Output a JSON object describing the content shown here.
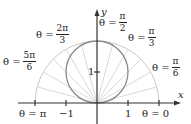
{
  "diagram": {
    "type": "polar-graph",
    "curve": "r = 2 sin θ",
    "axes": {
      "x_label": "x",
      "y_label": "y",
      "x_ticks": [
        {
          "value": -2,
          "label": "θ = π"
        },
        {
          "value": -1,
          "label": "−1"
        },
        {
          "value": 1,
          "label": "1"
        },
        {
          "value": 2,
          "label": "θ = 0"
        }
      ],
      "y_ticks": [
        {
          "value": 1,
          "label": "1"
        }
      ]
    },
    "angle_labels": [
      {
        "id": "pi_over_2",
        "prefix": "θ =",
        "num": "π",
        "den": "2"
      },
      {
        "id": "pi_over_3",
        "prefix": "θ =",
        "num": "π",
        "den": "3"
      },
      {
        "id": "pi_over_6",
        "prefix": "θ =",
        "num": "π",
        "den": "6"
      },
      {
        "id": "two_pi_over_3",
        "prefix": "θ =",
        "num": "2π",
        "den": "3"
      },
      {
        "id": "five_pi_over_6",
        "prefix": "θ =",
        "num": "5π",
        "den": "6"
      }
    ],
    "bottom_labels": {
      "theta_pi": "θ = π",
      "minus_one": "−1",
      "one": "1",
      "theta_zero": "θ = 0"
    },
    "y_one_label": "1",
    "colors": {
      "axis": "#333333",
      "circle": "#8a8a8a",
      "rays": "#c8c8c8",
      "semicircle": "#c8c8c8"
    }
  }
}
